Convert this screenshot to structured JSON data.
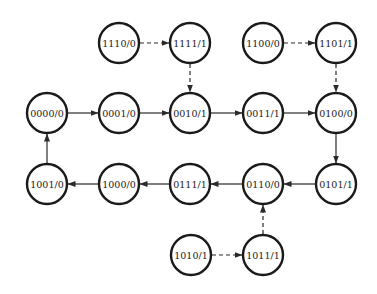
{
  "diagram": {
    "type": "state-transition-diagram",
    "node_radius": 20,
    "colors": {
      "stroke": "#1a1a1a",
      "fill": "#ffffff",
      "edge": "#2a2a2a"
    },
    "nodes": [
      {
        "id": "1110",
        "label": "1110/0",
        "x": 119,
        "y": 43
      },
      {
        "id": "1111",
        "label": "1111/1",
        "x": 190,
        "y": 43
      },
      {
        "id": "1100",
        "label": "1100/0",
        "x": 263,
        "y": 43
      },
      {
        "id": "1101",
        "label": "1101/1",
        "x": 336,
        "y": 43
      },
      {
        "id": "0000",
        "label": "0000/0",
        "x": 47,
        "y": 113
      },
      {
        "id": "0001",
        "label": "0001/0",
        "x": 119,
        "y": 113
      },
      {
        "id": "0010",
        "label": "0010/1",
        "x": 190,
        "y": 113
      },
      {
        "id": "0011",
        "label": "0011/1",
        "x": 263,
        "y": 113
      },
      {
        "id": "0100",
        "label": "0100/0",
        "x": 336,
        "y": 113
      },
      {
        "id": "1001",
        "label": "1001/0",
        "x": 47,
        "y": 184
      },
      {
        "id": "1000",
        "label": "1000/0",
        "x": 119,
        "y": 184
      },
      {
        "id": "0111",
        "label": "0111/1",
        "x": 190,
        "y": 184
      },
      {
        "id": "0110",
        "label": "0110/0",
        "x": 263,
        "y": 184
      },
      {
        "id": "0101",
        "label": "0101/1",
        "x": 336,
        "y": 184
      },
      {
        "id": "1010",
        "label": "1010/1",
        "x": 191,
        "y": 255
      },
      {
        "id": "1011",
        "label": "1011/1",
        "x": 263,
        "y": 255
      }
    ],
    "edges": [
      {
        "from": "0000",
        "to": "0001",
        "style": "solid"
      },
      {
        "from": "0001",
        "to": "0010",
        "style": "solid"
      },
      {
        "from": "0010",
        "to": "0011",
        "style": "solid"
      },
      {
        "from": "0011",
        "to": "0100",
        "style": "solid"
      },
      {
        "from": "0100",
        "to": "0101",
        "style": "solid"
      },
      {
        "from": "0101",
        "to": "0110",
        "style": "solid"
      },
      {
        "from": "0110",
        "to": "0111",
        "style": "solid"
      },
      {
        "from": "0111",
        "to": "1000",
        "style": "solid"
      },
      {
        "from": "1000",
        "to": "1001",
        "style": "solid"
      },
      {
        "from": "1001",
        "to": "0000",
        "style": "solid"
      },
      {
        "from": "1110",
        "to": "1111",
        "style": "dashed"
      },
      {
        "from": "1111",
        "to": "0010",
        "style": "dashed"
      },
      {
        "from": "1100",
        "to": "1101",
        "style": "dashed"
      },
      {
        "from": "1101",
        "to": "0100",
        "style": "dashed"
      },
      {
        "from": "1010",
        "to": "1011",
        "style": "dashed"
      },
      {
        "from": "1011",
        "to": "0110",
        "style": "dashed"
      }
    ]
  }
}
